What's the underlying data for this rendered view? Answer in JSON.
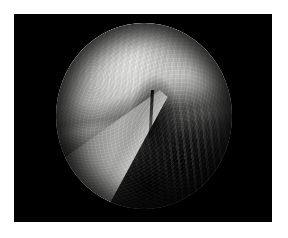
{
  "page": {
    "background_color": "#ffffff",
    "width": 288,
    "height": 238
  },
  "video_frame": {
    "background_color": "#000000",
    "left": 14,
    "top": 14,
    "width": 258,
    "height": 208,
    "label": "Endoscopic capture frame"
  },
  "scope_view": {
    "shape": "circle",
    "center_x": 143,
    "center_y": 115,
    "radius_x": 88,
    "radius_y": 93,
    "label": "Circular endoscope field of view",
    "modality": "Arthroscopy",
    "color_mode": "Grayscale"
  },
  "scene": {
    "regions": [
      {
        "name": "tissue-upper",
        "label": "Bright tissue surface (upper field)",
        "tone": "#e8e8e6",
        "position": "upper-left to upper-centre"
      },
      {
        "name": "tissue-upper-right",
        "label": "Secondary tissue lobe",
        "tone": "#d6d6d4",
        "position": "upper-right"
      },
      {
        "name": "fold-band",
        "label": "Horizontal tissue fold / ridge",
        "tone": "#767674",
        "position": "mid-upper, crossing left to right"
      },
      {
        "name": "cavity-shadow",
        "label": "Shadowed joint cavity",
        "tone": "#141414",
        "position": "lower-right quadrant"
      },
      {
        "name": "cavity-deep",
        "label": "Deep dark recess",
        "tone": "#000000",
        "position": "bottom-centre"
      },
      {
        "name": "crevice",
        "label": "Dark crevice beside instrument tip",
        "tone": "#0a0a0a",
        "position": "centre"
      },
      {
        "name": "dark-spot",
        "label": "Punctate dark mark on tissue",
        "tone": "#000000",
        "position": "lower-left-centre"
      }
    ],
    "instrument": {
      "name": "surgical-probe",
      "label": "Surgical instrument tip entering from lower-left",
      "body_tone": "#9a9a98",
      "highlight_tone": "#ffffff",
      "edge_tone": "#000000",
      "entry_side": "lower-left"
    }
  }
}
